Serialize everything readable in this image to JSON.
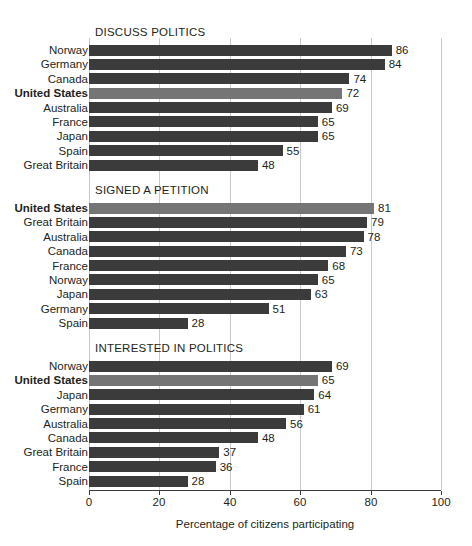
{
  "chart_data": {
    "type": "bar",
    "orientation": "horizontal",
    "title": "",
    "xlabel": "Percentage of citizens participating",
    "ylabel": "",
    "xlim": [
      0,
      100
    ],
    "xticks": [
      0,
      20,
      40,
      60,
      80,
      100
    ],
    "xtick_labels": [
      "0",
      "20",
      "40",
      "60",
      "80",
      "100"
    ],
    "grid": true,
    "legend": null,
    "highlight_category": "United States",
    "colors": {
      "bar": "#3b3b3b",
      "bar_highlight": "#757575",
      "gridline": "#c9c9c9",
      "axis": "#3b3b3b",
      "text": "#231f20",
      "background": "#ffffff"
    },
    "panels": [
      {
        "title": "DISCUSS POLITICS",
        "categories": [
          "Norway",
          "Germany",
          "Canada",
          "United States",
          "Australia",
          "France",
          "Japan",
          "Spain",
          "Great Britain"
        ],
        "values": [
          86,
          84,
          74,
          72,
          69,
          65,
          65,
          55,
          48
        ],
        "highlight": [
          false,
          false,
          false,
          true,
          false,
          false,
          false,
          false,
          false
        ]
      },
      {
        "title": "SIGNED A PETITION",
        "categories": [
          "United States",
          "Great Britain",
          "Australia",
          "Canada",
          "France",
          "Norway",
          "Japan",
          "Germany",
          "Spain"
        ],
        "values": [
          81,
          79,
          78,
          73,
          68,
          65,
          63,
          51,
          28
        ],
        "highlight": [
          true,
          false,
          false,
          false,
          false,
          false,
          false,
          false,
          false
        ]
      },
      {
        "title": "INTERESTED IN POLITICS",
        "categories": [
          "Norway",
          "United States",
          "Japan",
          "Germany",
          "Australia",
          "Canada",
          "Great Britain",
          "France",
          "Spain"
        ],
        "values": [
          69,
          65,
          64,
          61,
          56,
          48,
          37,
          36,
          28
        ],
        "highlight": [
          false,
          true,
          false,
          false,
          false,
          false,
          false,
          false,
          false
        ]
      }
    ]
  }
}
